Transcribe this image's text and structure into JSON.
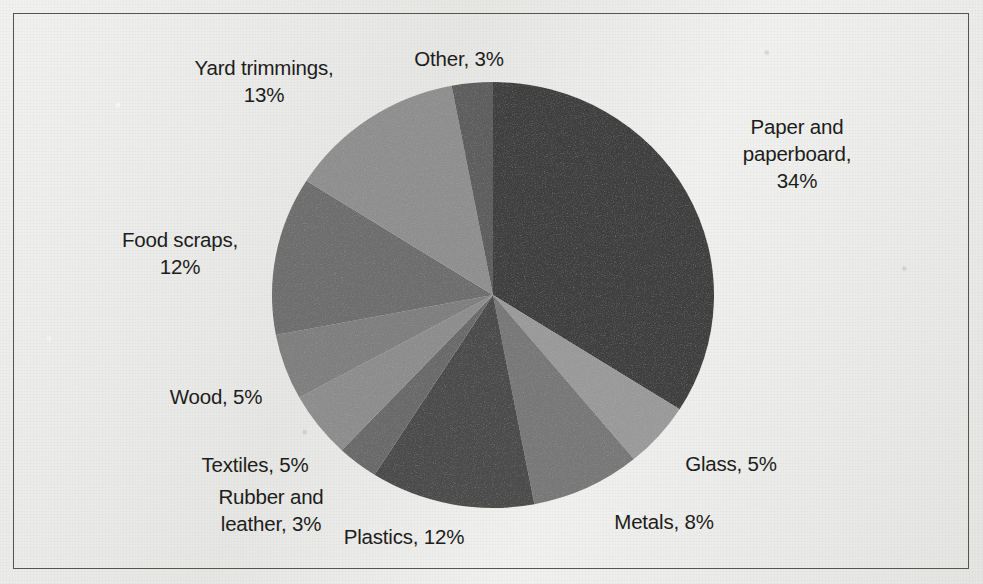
{
  "figure": {
    "kind": "scanned-pie-chart",
    "background_color": "#e9e9e7",
    "frame_color": "#54544f",
    "label_color": "#1d1d1b"
  },
  "chart_data": {
    "type": "pie",
    "title": "",
    "subtitle": "",
    "xlabel": "",
    "ylabel": "",
    "grid": false,
    "legend": "none",
    "label_format": "{name}, {value}%",
    "units": "percent",
    "total": 100,
    "start_angle_deg": 0,
    "direction": "clockwise",
    "categories": [
      "Paper and paperboard",
      "Glass",
      "Metals",
      "Plastics",
      "Rubber and leather",
      "Textiles",
      "Wood",
      "Food scraps",
      "Yard trimmings",
      "Other"
    ],
    "values": [
      34,
      5,
      8,
      12,
      3,
      5,
      5,
      12,
      13,
      3
    ],
    "colors": [
      "#3f3f3f",
      "#9a9a9a",
      "#787878",
      "#4b4b4b",
      "#6a6a6a",
      "#8d8d8d",
      "#7f7f7f",
      "#6e6e6e",
      "#8f8f8f",
      "#5e5e5e"
    ],
    "slices": [
      {
        "name": "Paper and paperboard",
        "value": 34,
        "color": "#3f3f3f",
        "label": "Paper and\npaperboard,\n34%",
        "label_x": 797,
        "label_y": 153
      },
      {
        "name": "Glass",
        "value": 5,
        "color": "#9a9a9a",
        "label": "Glass, 5%",
        "label_x": 731,
        "label_y": 463
      },
      {
        "name": "Metals",
        "value": 8,
        "color": "#787878",
        "label": "Metals, 8%",
        "label_x": 664,
        "label_y": 521
      },
      {
        "name": "Plastics",
        "value": 12,
        "color": "#4b4b4b",
        "label": "Plastics, 12%",
        "label_x": 404,
        "label_y": 536
      },
      {
        "name": "Rubber and leather",
        "value": 3,
        "color": "#6a6a6a",
        "label": "Rubber and\nleather, 3%",
        "label_x": 271,
        "label_y": 510
      },
      {
        "name": "Textiles",
        "value": 5,
        "color": "#8d8d8d",
        "label": "Textiles, 5%",
        "label_x": 255,
        "label_y": 464
      },
      {
        "name": "Wood",
        "value": 5,
        "color": "#7f7f7f",
        "label": "Wood, 5%",
        "label_x": 216,
        "label_y": 396
      },
      {
        "name": "Food scraps",
        "value": 12,
        "color": "#6e6e6e",
        "label": "Food scraps,\n12%",
        "label_x": 180,
        "label_y": 253
      },
      {
        "name": "Yard trimmings",
        "value": 13,
        "color": "#8f8f8f",
        "label": "Yard trimmings,\n13%",
        "label_x": 264,
        "label_y": 81
      },
      {
        "name": "Other",
        "value": 3,
        "color": "#5e5e5e",
        "label": "Other, 3%",
        "label_x": 459,
        "label_y": 58
      }
    ],
    "geometry": {
      "center_x": 493,
      "center_y": 295,
      "radius_x": 221,
      "radius_y": 213
    }
  }
}
